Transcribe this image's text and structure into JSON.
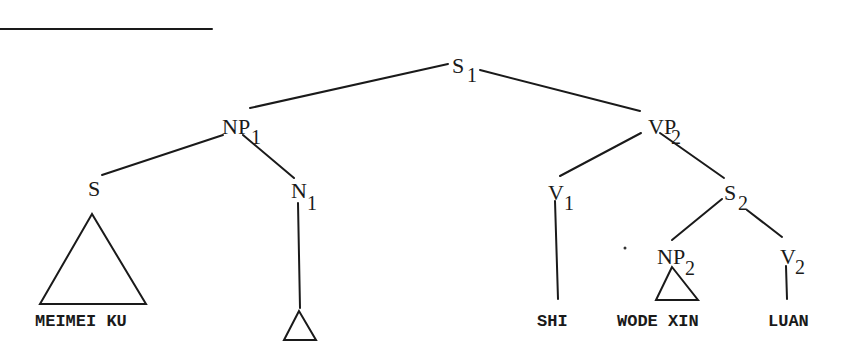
{
  "diagram": {
    "type": "syntax-tree",
    "nodes": [
      {
        "id": "S1",
        "label": "S",
        "subscript": "1"
      },
      {
        "id": "NP1",
        "label": "NP",
        "subscript": "1"
      },
      {
        "id": "VP2",
        "label": "VP",
        "subscript": "2"
      },
      {
        "id": "S",
        "label": "S",
        "subscript": ""
      },
      {
        "id": "N1",
        "label": "N",
        "subscript": "1"
      },
      {
        "id": "V1",
        "label": "V",
        "subscript": "1"
      },
      {
        "id": "S2",
        "label": "S",
        "subscript": "2"
      },
      {
        "id": "NP2",
        "label": "NP",
        "subscript": "2"
      },
      {
        "id": "V2",
        "label": "V",
        "subscript": "2"
      }
    ],
    "edges": [
      [
        "S1",
        "NP1"
      ],
      [
        "S1",
        "VP2"
      ],
      [
        "NP1",
        "S"
      ],
      [
        "NP1",
        "N1"
      ],
      [
        "VP2",
        "V1"
      ],
      [
        "VP2",
        "S2"
      ],
      [
        "S2",
        "NP2"
      ],
      [
        "S2",
        "V2"
      ]
    ],
    "leaves": {
      "meimei_ku": "MEIMEI KU",
      "shi": "SHI",
      "wode_xin": "WODE XIN",
      "luan": "LUAN"
    }
  }
}
